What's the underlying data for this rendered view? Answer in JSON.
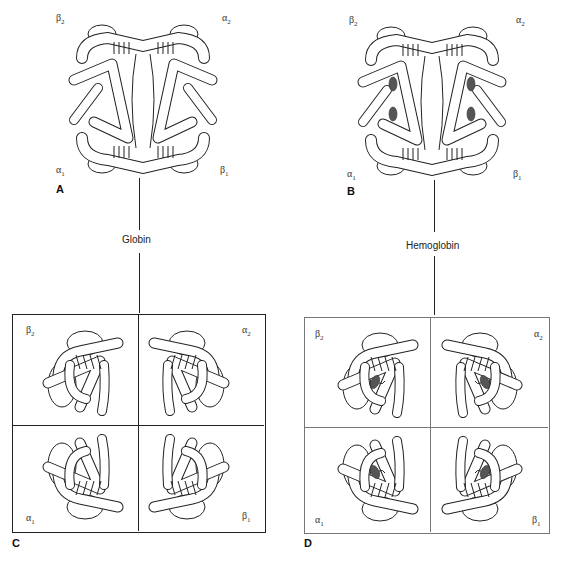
{
  "figure": {
    "panels": [
      {
        "letter": "A",
        "labels": {
          "top_left": "β",
          "top_left_sub": "2",
          "top_right": "α",
          "top_right_sub": "2",
          "bottom_left": "α",
          "bottom_left_sub": "1",
          "bottom_right": "β",
          "bottom_right_sub": "1"
        },
        "heme": false
      },
      {
        "letter": "B",
        "labels": {
          "top_left": "β",
          "top_left_sub": "2",
          "top_right": "α",
          "top_right_sub": "2",
          "bottom_left": "α",
          "bottom_left_sub": "1",
          "bottom_right": "β",
          "bottom_right_sub": "1"
        },
        "heme": true
      },
      {
        "letter": "C",
        "labels": {
          "top_left": "β",
          "top_left_sub": "2",
          "top_right": "α",
          "top_right_sub": "2",
          "bottom_left": "α",
          "bottom_left_sub": "1",
          "bottom_right": "β",
          "bottom_right_sub": "1"
        },
        "heme": false
      },
      {
        "letter": "D",
        "labels": {
          "top_left": "β",
          "top_left_sub": "2",
          "top_right": "α",
          "top_right_sub": "2",
          "bottom_left": "α",
          "bottom_left_sub": "1",
          "bottom_right": "β",
          "bottom_right_sub": "1"
        },
        "heme": true
      }
    ],
    "connectors": [
      {
        "label": "Globin"
      },
      {
        "label": "Hemoglobin"
      }
    ]
  }
}
